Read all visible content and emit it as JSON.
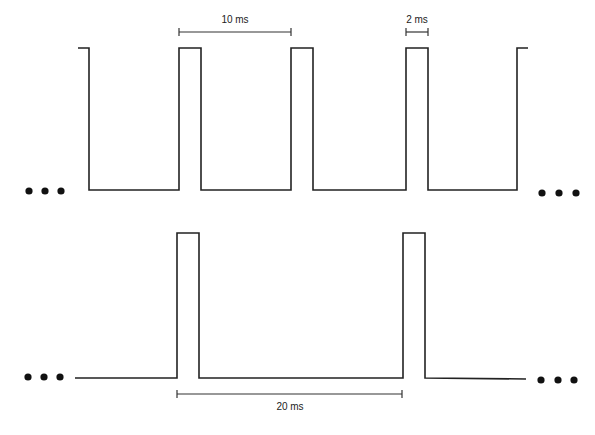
{
  "diagram": {
    "title": "",
    "top_waveform": {
      "period_label": "10 ms",
      "pulse_width_label": "2 ms",
      "continuation_left": "...",
      "continuation_right": "..."
    },
    "bottom_waveform": {
      "period_label": "20 ms",
      "continuation_left": "...",
      "continuation_right": "..."
    }
  },
  "colors": {
    "line": "#222222",
    "background": "#ffffff"
  }
}
